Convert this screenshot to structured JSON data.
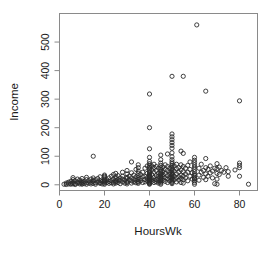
{
  "chart_data": {
    "type": "scatter",
    "title": "",
    "xlabel": "HoursWk",
    "ylabel": "Income",
    "xlim": [
      0,
      88
    ],
    "ylim": [
      -20,
      600
    ],
    "xticks": [
      0,
      20,
      40,
      60,
      80
    ],
    "yticks": [
      0,
      100,
      200,
      300,
      400,
      500
    ],
    "xtick_labels": [
      "0",
      "20",
      "40",
      "60",
      "80"
    ],
    "ytick_labels": [
      "0",
      "100",
      "200",
      "300",
      "400",
      "500"
    ],
    "grid": false,
    "legend": null,
    "marker": "open-circle",
    "marker_color": "#2b2b2b",
    "frame_color": "#8a8a8a",
    "points": [
      [
        2,
        2
      ],
      [
        3,
        1
      ],
      [
        3,
        6
      ],
      [
        4,
        3
      ],
      [
        4,
        9
      ],
      [
        5,
        2
      ],
      [
        5,
        12
      ],
      [
        5,
        5
      ],
      [
        6,
        8
      ],
      [
        6,
        18
      ],
      [
        6,
        3
      ],
      [
        6,
        25
      ],
      [
        7,
        4
      ],
      [
        7,
        14
      ],
      [
        7,
        1
      ],
      [
        8,
        6
      ],
      [
        8,
        20
      ],
      [
        8,
        10
      ],
      [
        9,
        3
      ],
      [
        9,
        16
      ],
      [
        9,
        7
      ],
      [
        10,
        2
      ],
      [
        10,
        9
      ],
      [
        10,
        22
      ],
      [
        10,
        5
      ],
      [
        10,
        13
      ],
      [
        11,
        4
      ],
      [
        11,
        11
      ],
      [
        12,
        8
      ],
      [
        12,
        18
      ],
      [
        12,
        2
      ],
      [
        12,
        26
      ],
      [
        13,
        6
      ],
      [
        13,
        14
      ],
      [
        14,
        9
      ],
      [
        14,
        3
      ],
      [
        14,
        20
      ],
      [
        15,
        100
      ],
      [
        15,
        12
      ],
      [
        15,
        5
      ],
      [
        15,
        24
      ],
      [
        15,
        16
      ],
      [
        16,
        7
      ],
      [
        16,
        18
      ],
      [
        16,
        2
      ],
      [
        17,
        10
      ],
      [
        17,
        22
      ],
      [
        18,
        5
      ],
      [
        18,
        14
      ],
      [
        18,
        28
      ],
      [
        18,
        8
      ],
      [
        19,
        12
      ],
      [
        19,
        3
      ],
      [
        20,
        16
      ],
      [
        20,
        26
      ],
      [
        20,
        6
      ],
      [
        20,
        34
      ],
      [
        20,
        10
      ],
      [
        20,
        20
      ],
      [
        20,
        2
      ],
      [
        20,
        30
      ],
      [
        20,
        13
      ],
      [
        21,
        8
      ],
      [
        21,
        18
      ],
      [
        22,
        24
      ],
      [
        22,
        5
      ],
      [
        22,
        12
      ],
      [
        23,
        15
      ],
      [
        23,
        30
      ],
      [
        23,
        7
      ],
      [
        24,
        20
      ],
      [
        24,
        9
      ],
      [
        24,
        36
      ],
      [
        24,
        3
      ],
      [
        25,
        14
      ],
      [
        25,
        28
      ],
      [
        25,
        6
      ],
      [
        25,
        22
      ],
      [
        25,
        40
      ],
      [
        25,
        11
      ],
      [
        26,
        18
      ],
      [
        26,
        8
      ],
      [
        26,
        32
      ],
      [
        27,
        24
      ],
      [
        27,
        4
      ],
      [
        27,
        15
      ],
      [
        28,
        30
      ],
      [
        28,
        10
      ],
      [
        28,
        20
      ],
      [
        28,
        44
      ],
      [
        29,
        16
      ],
      [
        29,
        6
      ],
      [
        30,
        26
      ],
      [
        30,
        12
      ],
      [
        30,
        38
      ],
      [
        30,
        8
      ],
      [
        30,
        22
      ],
      [
        30,
        50
      ],
      [
        30,
        3
      ],
      [
        31,
        18
      ],
      [
        31,
        30
      ],
      [
        32,
        80
      ],
      [
        32,
        14
      ],
      [
        32,
        24
      ],
      [
        32,
        6
      ],
      [
        32,
        42
      ],
      [
        33,
        20
      ],
      [
        33,
        10
      ],
      [
        33,
        34
      ],
      [
        34,
        28
      ],
      [
        34,
        16
      ],
      [
        34,
        54
      ],
      [
        34,
        7
      ],
      [
        35,
        24
      ],
      [
        35,
        12
      ],
      [
        35,
        40
      ],
      [
        35,
        60
      ],
      [
        35,
        18
      ],
      [
        35,
        32
      ],
      [
        35,
        5
      ],
      [
        35,
        48
      ],
      [
        35,
        9
      ],
      [
        35,
        70
      ],
      [
        36,
        22
      ],
      [
        36,
        36
      ],
      [
        36,
        14
      ],
      [
        37,
        28
      ],
      [
        37,
        8
      ],
      [
        37,
        44
      ],
      [
        38,
        30
      ],
      [
        38,
        18
      ],
      [
        38,
        58
      ],
      [
        38,
        10
      ],
      [
        39,
        24
      ],
      [
        39,
        40
      ],
      [
        39,
        14
      ],
      [
        39,
        66
      ],
      [
        40,
        318
      ],
      [
        40,
        200
      ],
      [
        40,
        126
      ],
      [
        40,
        96
      ],
      [
        40,
        82
      ],
      [
        40,
        74
      ],
      [
        40,
        68
      ],
      [
        40,
        62
      ],
      [
        40,
        56
      ],
      [
        40,
        50
      ],
      [
        40,
        46
      ],
      [
        40,
        42
      ],
      [
        40,
        38
      ],
      [
        40,
        34
      ],
      [
        40,
        30
      ],
      [
        40,
        28
      ],
      [
        40,
        26
      ],
      [
        40,
        24
      ],
      [
        40,
        22
      ],
      [
        40,
        20
      ],
      [
        40,
        18
      ],
      [
        40,
        16
      ],
      [
        40,
        14
      ],
      [
        40,
        12
      ],
      [
        40,
        10
      ],
      [
        40,
        8
      ],
      [
        40,
        6
      ],
      [
        40,
        4
      ],
      [
        40,
        2
      ],
      [
        41,
        36
      ],
      [
        41,
        20
      ],
      [
        41,
        52
      ],
      [
        41,
        12
      ],
      [
        41,
        66
      ],
      [
        42,
        44
      ],
      [
        42,
        26
      ],
      [
        42,
        16
      ],
      [
        42,
        60
      ],
      [
        42,
        8
      ],
      [
        42,
        72
      ],
      [
        43,
        32
      ],
      [
        43,
        18
      ],
      [
        43,
        50
      ],
      [
        43,
        10
      ],
      [
        43,
        64
      ],
      [
        44,
        40
      ],
      [
        44,
        22
      ],
      [
        44,
        14
      ],
      [
        44,
        58
      ],
      [
        44,
        6
      ],
      [
        44,
        30
      ],
      [
        45,
        88
      ],
      [
        45,
        76
      ],
      [
        45,
        68
      ],
      [
        45,
        60
      ],
      [
        45,
        54
      ],
      [
        45,
        48
      ],
      [
        45,
        42
      ],
      [
        45,
        38
      ],
      [
        45,
        34
      ],
      [
        45,
        30
      ],
      [
        45,
        26
      ],
      [
        45,
        22
      ],
      [
        45,
        18
      ],
      [
        45,
        14
      ],
      [
        45,
        10
      ],
      [
        45,
        6
      ],
      [
        45,
        2
      ],
      [
        45,
        104
      ],
      [
        46,
        46
      ],
      [
        46,
        28
      ],
      [
        46,
        62
      ],
      [
        46,
        16
      ],
      [
        46,
        36
      ],
      [
        47,
        54
      ],
      [
        47,
        24
      ],
      [
        47,
        70
      ],
      [
        47,
        12
      ],
      [
        47,
        40
      ],
      [
        48,
        108
      ],
      [
        48,
        50
      ],
      [
        48,
        32
      ],
      [
        48,
        20
      ],
      [
        48,
        64
      ],
      [
        48,
        8
      ],
      [
        49,
        44
      ],
      [
        49,
        26
      ],
      [
        49,
        58
      ],
      [
        49,
        14
      ],
      [
        49,
        36
      ],
      [
        50,
        178
      ],
      [
        50,
        168
      ],
      [
        50,
        158
      ],
      [
        50,
        148
      ],
      [
        50,
        138
      ],
      [
        50,
        128
      ],
      [
        50,
        112
      ],
      [
        50,
        98
      ],
      [
        50,
        88
      ],
      [
        50,
        80
      ],
      [
        50,
        74
      ],
      [
        50,
        68
      ],
      [
        50,
        62
      ],
      [
        50,
        56
      ],
      [
        50,
        50
      ],
      [
        50,
        44
      ],
      [
        50,
        40
      ],
      [
        50,
        36
      ],
      [
        50,
        32
      ],
      [
        50,
        28
      ],
      [
        50,
        24
      ],
      [
        50,
        20
      ],
      [
        50,
        16
      ],
      [
        50,
        12
      ],
      [
        50,
        8
      ],
      [
        50,
        4
      ],
      [
        50,
        380
      ],
      [
        51,
        48
      ],
      [
        51,
        30
      ],
      [
        51,
        66
      ],
      [
        51,
        18
      ],
      [
        52,
        56
      ],
      [
        52,
        38
      ],
      [
        52,
        24
      ],
      [
        52,
        72
      ],
      [
        52,
        10
      ],
      [
        53,
        44
      ],
      [
        53,
        28
      ],
      [
        53,
        60
      ],
      [
        53,
        16
      ],
      [
        54,
        118
      ],
      [
        54,
        70
      ],
      [
        54,
        52
      ],
      [
        54,
        34
      ],
      [
        54,
        22
      ],
      [
        54,
        8
      ],
      [
        55,
        380
      ],
      [
        55,
        110
      ],
      [
        55,
        64
      ],
      [
        55,
        46
      ],
      [
        55,
        30
      ],
      [
        55,
        18
      ],
      [
        55,
        6
      ],
      [
        56,
        58
      ],
      [
        56,
        38
      ],
      [
        56,
        24
      ],
      [
        57,
        68
      ],
      [
        57,
        44
      ],
      [
        57,
        14
      ],
      [
        58,
        54
      ],
      [
        58,
        30
      ],
      [
        58,
        80
      ],
      [
        59,
        42
      ],
      [
        59,
        20
      ],
      [
        60,
        96
      ],
      [
        60,
        86
      ],
      [
        60,
        78
      ],
      [
        60,
        70
      ],
      [
        60,
        62
      ],
      [
        60,
        54
      ],
      [
        60,
        46
      ],
      [
        60,
        38
      ],
      [
        60,
        32
      ],
      [
        60,
        26
      ],
      [
        60,
        20
      ],
      [
        60,
        14
      ],
      [
        60,
        8
      ],
      [
        60,
        2
      ],
      [
        60,
        22
      ],
      [
        61,
        560
      ],
      [
        62,
        58
      ],
      [
        62,
        34
      ],
      [
        62,
        16
      ],
      [
        63,
        72
      ],
      [
        63,
        44
      ],
      [
        64,
        50
      ],
      [
        64,
        26
      ],
      [
        65,
        328
      ],
      [
        65,
        92
      ],
      [
        65,
        60
      ],
      [
        65,
        38
      ],
      [
        65,
        18
      ],
      [
        66,
        54
      ],
      [
        66,
        30
      ],
      [
        67,
        66
      ],
      [
        67,
        42
      ],
      [
        68,
        48
      ],
      [
        68,
        24
      ],
      [
        69,
        58
      ],
      [
        69,
        4
      ],
      [
        70,
        74
      ],
      [
        70,
        56
      ],
      [
        70,
        40
      ],
      [
        70,
        20
      ],
      [
        70,
        2
      ],
      [
        71,
        62
      ],
      [
        71,
        36
      ],
      [
        72,
        50
      ],
      [
        73,
        44
      ],
      [
        74,
        60
      ],
      [
        75,
        46
      ],
      [
        75,
        30
      ],
      [
        78,
        52
      ],
      [
        80,
        294
      ],
      [
        80,
        76
      ],
      [
        80,
        68
      ],
      [
        80,
        60
      ],
      [
        80,
        30
      ],
      [
        84,
        2
      ]
    ]
  }
}
